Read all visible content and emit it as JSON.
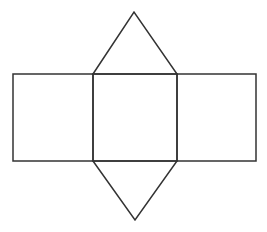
{
  "diagram": {
    "stroke_color": "#333333",
    "background": "#ffffff",
    "faces": [
      {
        "name": "left-rectangle",
        "points": "13,74 93,74 93,161 13,161"
      },
      {
        "name": "center-rectangle",
        "points": "93,74 177,74 177,161 93,161"
      },
      {
        "name": "right-rectangle",
        "points": "177,74 256,74 256,161 177,161"
      },
      {
        "name": "top-triangle",
        "points": "93,74 134,12 177,74"
      },
      {
        "name": "bottom-triangle",
        "points": "93,161 135,220 177,161"
      }
    ]
  }
}
